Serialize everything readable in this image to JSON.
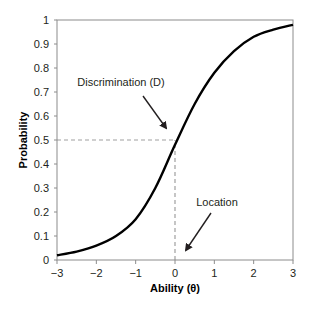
{
  "chart_data": {
    "type": "line",
    "title": "",
    "xlabel": "Ability (θ)",
    "ylabel": "Probability",
    "xlim": [
      -3,
      3
    ],
    "ylim": [
      0,
      1
    ],
    "grid": false,
    "legend": null,
    "x_ticks": [
      "-3",
      "-2",
      "-1",
      "0",
      "1",
      "2",
      "3"
    ],
    "y_ticks": [
      "0",
      "0.1",
      "0.2",
      "0.3",
      "0.4",
      "0.5",
      "0.6",
      "0.7",
      "0.8",
      "0.9",
      "1"
    ],
    "series": [
      {
        "name": "Item characteristic curve",
        "x": [
          -3,
          -2.5,
          -2,
          -1.5,
          -1,
          -0.5,
          0,
          0.5,
          1,
          1.5,
          2,
          2.5,
          3
        ],
        "y": [
          0.02,
          0.035,
          0.06,
          0.1,
          0.17,
          0.3,
          0.48,
          0.65,
          0.78,
          0.87,
          0.93,
          0.96,
          0.98
        ],
        "color": "#000000"
      }
    ],
    "reference_lines": [
      {
        "orientation": "horizontal",
        "value": 0.5,
        "from_x": -3,
        "to_x": 0,
        "style": "dashed",
        "color": "#a0a0a0"
      },
      {
        "orientation": "vertical",
        "value": 0,
        "from_y": 0,
        "to_y": 0.5,
        "style": "dashed",
        "color": "#a0a0a0"
      }
    ],
    "annotations": [
      {
        "text": "Discrimination (D)",
        "text_at": [
          -1.5,
          0.74
        ],
        "arrow_to": [
          -0.25,
          0.55
        ]
      },
      {
        "text": "Location",
        "text_at": [
          0.95,
          0.24
        ],
        "arrow_to": [
          0.28,
          0.04
        ]
      }
    ]
  }
}
